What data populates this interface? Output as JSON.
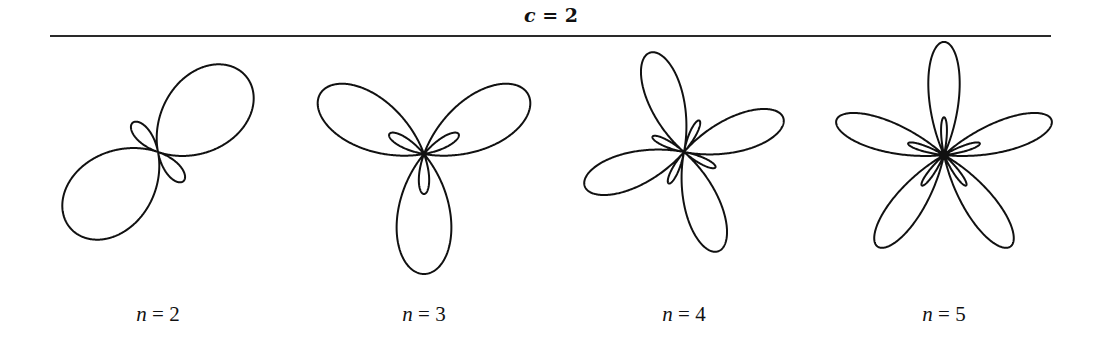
{
  "figure": {
    "title_var": "c",
    "title_eq": " = ",
    "title_val": "2",
    "stroke_color": "#111111",
    "panels": [
      {
        "label_var": "n",
        "label_eq": " = ",
        "label_val": "2",
        "n": 2,
        "c": 2,
        "cx": 158,
        "cy": 152,
        "scale": 38.7,
        "phase_deg": 41,
        "label_x": 98
      },
      {
        "label_var": "n",
        "label_eq": " = ",
        "label_val": "3",
        "n": 3,
        "c": 2,
        "cx": 424,
        "cy": 154,
        "scale": 40,
        "phase_deg": 270,
        "label_x": 364
      },
      {
        "label_var": "n",
        "label_eq": " = ",
        "label_val": "4",
        "n": 4,
        "c": 2,
        "cx": 684,
        "cy": 152,
        "scale": 35,
        "phase_deg": 109,
        "label_x": 624
      },
      {
        "label_var": "n",
        "label_eq": " = ",
        "label_val": "5",
        "n": 5,
        "c": 2,
        "cx": 944,
        "cy": 155,
        "scale": 37.7,
        "phase_deg": 90,
        "label_x": 884
      }
    ]
  },
  "chart_data": {
    "type": "line",
    "title": "c = 2",
    "series": [
      {
        "name": "n = 2",
        "n": 2,
        "c": 2,
        "big_petals": 2,
        "small_petals": 2
      },
      {
        "name": "n = 3",
        "n": 3,
        "c": 2,
        "big_petals": 3,
        "small_petals": 3
      },
      {
        "name": "n = 4",
        "n": 4,
        "c": 2,
        "big_petals": 4,
        "small_petals": 4
      },
      {
        "name": "n = 5",
        "n": 5,
        "c": 2,
        "big_petals": 5,
        "small_petals": 5
      }
    ],
    "xlabel": "",
    "ylabel": "",
    "grid": false,
    "legend": "none"
  }
}
